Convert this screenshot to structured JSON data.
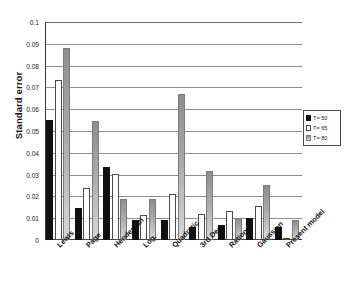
{
  "chart_data": {
    "type": "bar",
    "title": "",
    "xlabel": "",
    "ylabel": "Standard error",
    "ylim": [
      0,
      0.1
    ],
    "yticks": [
      "0",
      "0.01",
      "0.02",
      "0.03",
      "0.04",
      "0.05",
      "0.06",
      "0.07",
      "0.08",
      "0.09",
      "0.1"
    ],
    "grid": true,
    "legend_position": "right",
    "categories": [
      "Lewis",
      "Page",
      "Henderson",
      "Log.",
      "Quadratic",
      "3rd Deg.",
      "Rational",
      "Gaussian",
      "Present model"
    ],
    "series": [
      {
        "name": "T= 50",
        "color": "#111111",
        "values": [
          0.055,
          0.0145,
          0.0335,
          0.009,
          0.009,
          0.006,
          0.007,
          0.01,
          0.006
        ]
      },
      {
        "name": "T= 65",
        "color": "#ffffff",
        "values": [
          0.0732,
          0.024,
          0.0302,
          0.0115,
          0.021,
          0.0118,
          0.0135,
          0.0157,
          0.0009
        ]
      },
      {
        "name": "T= 80",
        "color": "#a9a9a9",
        "values": [
          0.088,
          0.0545,
          0.019,
          0.019,
          0.067,
          0.0318,
          0.0103,
          0.0252,
          0.009
        ]
      }
    ]
  },
  "legend": {
    "items": [
      {
        "label": "T= 50"
      },
      {
        "label": "T= 65"
      },
      {
        "label": "T= 80"
      }
    ]
  },
  "axis": {
    "y_title": "Standard error"
  }
}
